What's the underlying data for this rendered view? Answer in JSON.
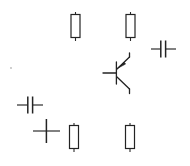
{
  "canvas": {
    "title": "Electronic circuit schematic",
    "width": 190,
    "height": 166,
    "background_color": "#ffffff",
    "ink_color": "#232323",
    "style": "hand-drawn line art, scattered unconnected symbols"
  },
  "components": [
    {
      "id": "r1",
      "type": "resistor",
      "label": "resistor-top-left",
      "orientation": "vertical",
      "x": 75.5,
      "y": 26,
      "body_width": 9,
      "body_height": 23,
      "lead_length": 7
    },
    {
      "id": "r2",
      "type": "resistor",
      "label": "resistor-top-right",
      "orientation": "vertical",
      "x": 130.5,
      "y": 26,
      "body_width": 9,
      "body_height": 23,
      "lead_length": 7
    },
    {
      "id": "r3",
      "type": "resistor",
      "label": "resistor-bottom-left",
      "orientation": "vertical",
      "x": 74,
      "y": 137,
      "body_width": 9,
      "body_height": 23,
      "lead_length": 7
    },
    {
      "id": "r4",
      "type": "resistor",
      "label": "resistor-bottom-right",
      "orientation": "vertical",
      "x": 130,
      "y": 137,
      "body_width": 9,
      "body_height": 23,
      "lead_length": 7
    },
    {
      "id": "c1",
      "type": "capacitor",
      "label": "capacitor-right",
      "orientation": "horizontal",
      "x": 163,
      "y": 49,
      "plate_height": 17,
      "plate_gap": 5,
      "lead_length": 12
    },
    {
      "id": "c2",
      "type": "capacitor",
      "label": "capacitor-left",
      "orientation": "horizontal",
      "x": 30,
      "y": 105,
      "plate_height": 17,
      "plate_gap": 5,
      "lead_length": 12
    },
    {
      "id": "x1",
      "type": "junction-cross",
      "label": "cross-junction-bottom-left",
      "x": 46,
      "y": 131,
      "arm_h": 14,
      "arm_v": 12
    },
    {
      "id": "q1",
      "type": "transistor",
      "subtype": "pnp-bipolar",
      "label": "pnp-transistor",
      "base_x": 104,
      "base_y": 73,
      "base_bar_x": 116,
      "base_bar_top": 62,
      "base_bar_bottom": 84,
      "collector_end_x": 131,
      "collector_end_y": 92,
      "emitter_end_x": 131,
      "emitter_end_y": 54,
      "arrow_on": "emitter",
      "arrow_points_toward": "base"
    },
    {
      "id": "d1",
      "type": "speck",
      "label": "stray-dot",
      "x": 11,
      "y": 68,
      "radius": 0.9
    }
  ]
}
